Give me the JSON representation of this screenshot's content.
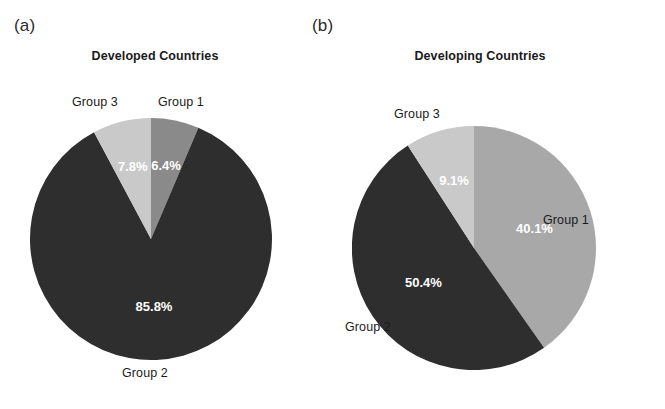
{
  "figure": {
    "panels": [
      {
        "tag": "(a)",
        "title": "Developed Countries"
      },
      {
        "tag": "(b)",
        "title": "Developing Countries"
      }
    ]
  },
  "colors": {
    "group1_a": "#8a8a8a",
    "group1_b": "#a8a8a8",
    "group2": "#2e2e2e",
    "group3": "#c9c9c9",
    "label_text": "#1a1a1a",
    "value_text": "#ffffff",
    "background": "#ffffff"
  },
  "labels": {
    "group1": "Group 1",
    "group2": "Group 2",
    "group3": "Group 3"
  },
  "chart_data": [
    {
      "type": "pie",
      "title": "Developed Countries",
      "panel": "(a)",
      "categories": [
        "Group 1",
        "Group 2",
        "Group 3"
      ],
      "values": [
        6.4,
        85.8,
        7.8
      ],
      "value_labels": [
        "6.4%",
        "85.8%",
        "7.8%"
      ],
      "colors": [
        "#8a8a8a",
        "#2e2e2e",
        "#c9c9c9"
      ],
      "units": "percent",
      "start_angle_deg": 0,
      "direction": "clockwise",
      "legend": "none",
      "labels_position": "outside-and-inside"
    },
    {
      "type": "pie",
      "title": "Developing Countries",
      "panel": "(b)",
      "categories": [
        "Group 1",
        "Group 2",
        "Group 3"
      ],
      "values": [
        40.1,
        50.4,
        9.1
      ],
      "value_labels": [
        "40.1%",
        "50.4%",
        "9.1%"
      ],
      "colors": [
        "#a8a8a8",
        "#2e2e2e",
        "#c9c9c9"
      ],
      "units": "percent",
      "start_angle_deg": 0,
      "direction": "clockwise",
      "legend": "none",
      "labels_position": "outside-and-inside"
    }
  ]
}
